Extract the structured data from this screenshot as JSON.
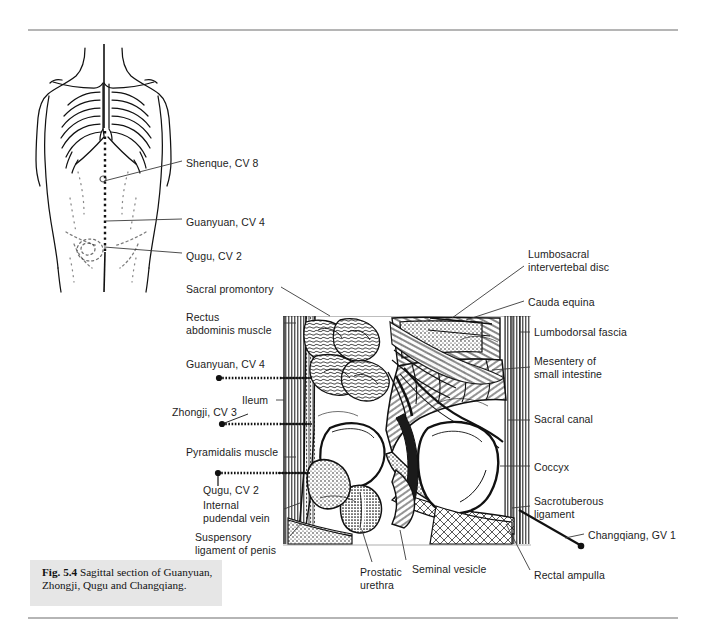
{
  "figure": {
    "caption_bold": "Fig. 5.4",
    "caption_text": "Sagittal section of Guanyuan, Zhongji, Qugu and Changqiang.",
    "caption_full": "Fig. 5.4  Sagittal section of Guanyuan, Zhongji, Qugu and Changqiang.",
    "background_color": "#ffffff",
    "rule_color": "#b5b5b5",
    "caption_bg_color": "#e6e6e6",
    "ink_color": "#1a1a1a"
  },
  "torso_diagram": {
    "name": "anterior-torso-line-drawing",
    "description": "Anterior view line drawing of male torso with ribcage and dotted midline conception vessel",
    "labels": [
      {
        "text": "Shenque, CV 8",
        "x": 186,
        "y": 163
      },
      {
        "text": "Guanyuan, CV 4",
        "x": 186,
        "y": 222
      },
      {
        "text": "Qugu, CV 2",
        "x": 186,
        "y": 256
      }
    ]
  },
  "sagittal_diagram": {
    "name": "sagittal-pelvis-section",
    "description": "Engraved sagittal section through the male pelvis",
    "labels_left": [
      {
        "text": "Sacral promontory",
        "x": 186,
        "y": 288
      },
      {
        "text": "Rectus\nabdominis muscle",
        "x": 186,
        "y": 316
      },
      {
        "text": "Guanyuan, CV 4",
        "x": 186,
        "y": 363
      },
      {
        "text": "Ileum",
        "x": 242,
        "y": 399
      },
      {
        "text": "Zhongji, CV 3",
        "x": 172,
        "y": 411
      },
      {
        "text": "Pyramidalis muscle",
        "x": 186,
        "y": 451
      },
      {
        "text": "Qugu, CV 2",
        "x": 203,
        "y": 489
      },
      {
        "text": "Internal\npudendal vein",
        "x": 203,
        "y": 504
      },
      {
        "text": "Suspensory\nligament of penis",
        "x": 195,
        "y": 536
      }
    ],
    "labels_right": [
      {
        "text": "Lumbosacral\nintervertebal disc",
        "x": 528,
        "y": 253
      },
      {
        "text": "Cauda equina",
        "x": 528,
        "y": 302
      },
      {
        "text": "Lumbodorsal fascia",
        "x": 534,
        "y": 331
      },
      {
        "text": "Mesentery of\nsmall intestine",
        "x": 534,
        "y": 361
      },
      {
        "text": "Sacral canal",
        "x": 534,
        "y": 418
      },
      {
        "text": "Coccyx",
        "x": 534,
        "y": 466
      },
      {
        "text": "Sacrotuberous\nligament",
        "x": 534,
        "y": 500
      },
      {
        "text": "Changqiang, GV 1",
        "x": 588,
        "y": 534
      },
      {
        "text": "Rectal ampulla",
        "x": 534,
        "y": 574
      }
    ],
    "labels_bottom": [
      {
        "text": "Prostatic\nurethra",
        "x": 360,
        "y": 571
      },
      {
        "text": "Seminal vesicle",
        "x": 410,
        "y": 568
      }
    ]
  },
  "acupuncture_points": [
    {
      "code": "CV 8",
      "name": "Shenque"
    },
    {
      "code": "CV 4",
      "name": "Guanyuan"
    },
    {
      "code": "CV 3",
      "name": "Zhongji"
    },
    {
      "code": "CV 2",
      "name": "Qugu"
    },
    {
      "code": "GV 1",
      "name": "Changqiang"
    }
  ]
}
